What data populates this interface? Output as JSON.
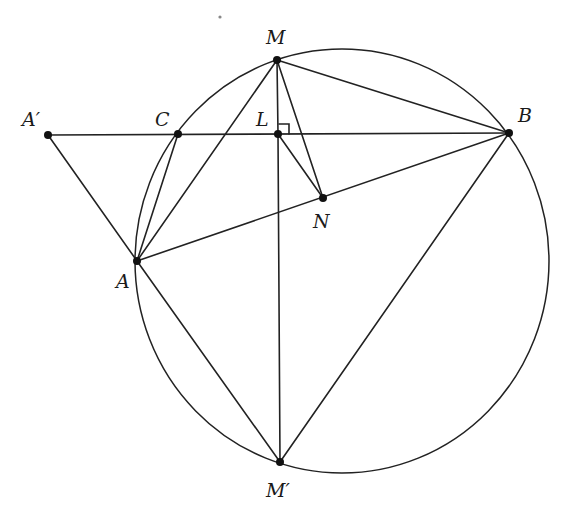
{
  "diagram": {
    "type": "geometry",
    "circle": {
      "cx": 342,
      "cy": 261,
      "rx": 207,
      "ry": 212,
      "through": [
        "M",
        "B",
        "M'",
        "A",
        "C"
      ]
    },
    "points": [
      {
        "id": "M",
        "label": "M",
        "x": 277,
        "y": 60,
        "lx": 266,
        "ly": 44
      },
      {
        "id": "A'",
        "label": "A′",
        "x": 48,
        "y": 135,
        "lx": 22,
        "ly": 126
      },
      {
        "id": "C",
        "label": "C",
        "x": 178,
        "y": 134,
        "lx": 155,
        "ly": 126
      },
      {
        "id": "L",
        "label": "L",
        "x": 278,
        "y": 134,
        "lx": 256,
        "ly": 126
      },
      {
        "id": "B",
        "label": "B",
        "x": 509,
        "y": 133,
        "lx": 518,
        "ly": 122
      },
      {
        "id": "N",
        "label": "N",
        "x": 323,
        "y": 198,
        "lx": 313,
        "ly": 228
      },
      {
        "id": "A",
        "label": "A",
        "x": 137,
        "y": 261,
        "lx": 116,
        "ly": 288
      },
      {
        "id": "M'",
        "label": "M′",
        "x": 280,
        "y": 462,
        "lx": 266,
        "ly": 497
      }
    ],
    "segments": [
      [
        "A'",
        "B"
      ],
      [
        "A'",
        "A"
      ],
      [
        "M",
        "A"
      ],
      [
        "M",
        "L"
      ],
      [
        "L",
        "M'"
      ],
      [
        "M",
        "N"
      ],
      [
        "M",
        "B"
      ],
      [
        "L",
        "N"
      ],
      [
        "A",
        "B"
      ],
      [
        "A",
        "C"
      ],
      [
        "A",
        "M'"
      ],
      [
        "B",
        "M'"
      ]
    ],
    "right_angle": {
      "at": "L",
      "size": 10
    }
  }
}
